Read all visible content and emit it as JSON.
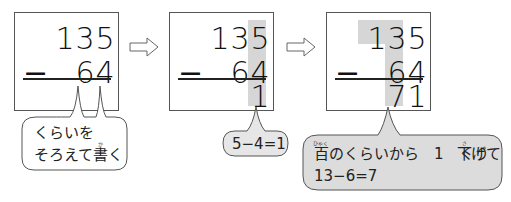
{
  "diagram": {
    "title": "",
    "colors": {
      "highlight": "#d6d6d6",
      "bubble_gray": "#dcdcdc",
      "bubble_light": "#e6e6e6",
      "border": "#555555"
    },
    "steps": [
      {
        "minuend": [
          "1",
          "3",
          "5"
        ],
        "operator": "−",
        "subtrahend": [
          "6",
          "4"
        ],
        "result": [],
        "highlight": "none"
      },
      {
        "minuend": [
          "1",
          "3",
          "5"
        ],
        "operator": "−",
        "subtrahend": [
          "6",
          "4"
        ],
        "result": [
          "1"
        ],
        "highlight": "ones-column"
      },
      {
        "minuend": [
          "1",
          "3",
          "5"
        ],
        "operator": "−",
        "subtrahend": [
          "6",
          "4"
        ],
        "result": [
          "7",
          "1"
        ],
        "highlight": "hundreds-and-tens-columns"
      }
    ],
    "arrows": [
      {
        "icon": "right-arrow-icon"
      },
      {
        "icon": "right-arrow-icon"
      }
    ],
    "bubbles": [
      {
        "line1": "くらいを",
        "line2_a": "そろえて",
        "line2_kanji": "書",
        "line2_ruby": "か",
        "line2_b": "く"
      },
      {
        "text": "5−4=1"
      },
      {
        "kanji1": "百",
        "ruby1": "ひゃく",
        "line1_a": "のくらいから　1　くり",
        "kanji2": "下",
        "ruby2": "さ",
        "line1_b": "げて",
        "line2": "13−6=7"
      }
    ]
  }
}
